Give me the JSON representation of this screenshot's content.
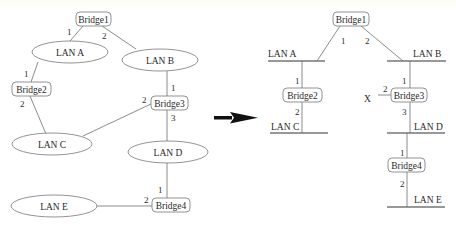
{
  "left": {
    "bridges": {
      "b1": "Bridge1",
      "b2": "Bridge2",
      "b3": "Bridge3",
      "b4": "Bridge4"
    },
    "lans": {
      "a": "LAN A",
      "b": "LAN B",
      "c": "LAN C",
      "d": "LAN D",
      "e": "LAN E"
    },
    "ports": {
      "b1_p1": "1",
      "b1_p2": "2",
      "b2_p1": "1",
      "b2_p2": "2",
      "b3_p1": "1",
      "b3_p2": "2",
      "b3_p3": "3",
      "b4_p1": "1",
      "b4_p2": "2"
    }
  },
  "right": {
    "bridges": {
      "b1": "Bridge1",
      "b2": "Bridge2",
      "b3": "Bridge3",
      "b4": "Bridge4"
    },
    "lans": {
      "a": "LAN A",
      "b": "LAN B",
      "c": "LAN C",
      "d": "LAN D",
      "e": "LAN E"
    },
    "ports": {
      "b1_p1": "1",
      "b1_p2": "2",
      "b2_p1": "1",
      "b2_p2": "2",
      "b3_p1": "1",
      "b3_p2": "2",
      "b3_p3": "3",
      "b4_p1": "1",
      "b4_p2": "2"
    },
    "blocked_marker": "X"
  },
  "arrow": {
    "meaning": "transforms-to"
  }
}
